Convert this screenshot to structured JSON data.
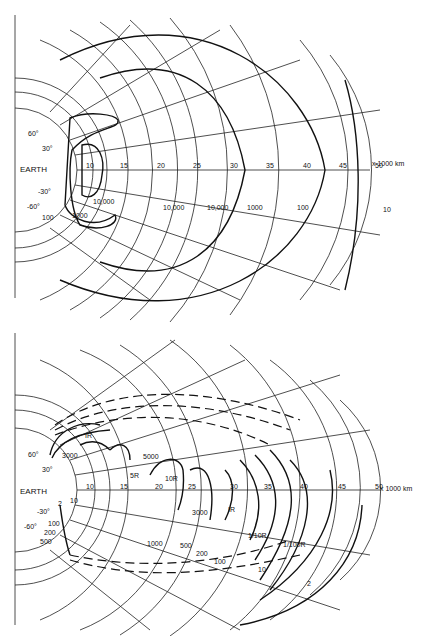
{
  "figure": {
    "top_panel": {
      "earth_label": "EARTH",
      "axis_unit": "x 1000 km",
      "axis_ticks": [
        "10",
        "15",
        "20",
        "25",
        "30",
        "35",
        "40",
        "45",
        "50"
      ],
      "latitude_labels": [
        "60°",
        "30°",
        "-30°",
        "-60°"
      ],
      "contour_labels": [
        "10,000",
        "1000",
        "100",
        "10,000",
        "10,000",
        "1000",
        "100",
        "10"
      ]
    },
    "bottom_panel": {
      "earth_label": "EARTH",
      "axis_unit": "x 1000 km",
      "axis_ticks": [
        "10",
        "15",
        "20",
        "25",
        "30",
        "35",
        "40",
        "45",
        "50"
      ],
      "latitude_labels": [
        "60°",
        "30°",
        "-30°",
        "-60°"
      ],
      "upper_labels": [
        "IR",
        "3000",
        "5R",
        "5000",
        "10R",
        "3000",
        "IR"
      ],
      "lower_labels": [
        "2",
        "10",
        "100",
        "200",
        "500",
        "1000",
        "500",
        "200",
        "100"
      ],
      "outer_labels": [
        "1/10R",
        "1/100R",
        "10",
        "2"
      ]
    }
  }
}
